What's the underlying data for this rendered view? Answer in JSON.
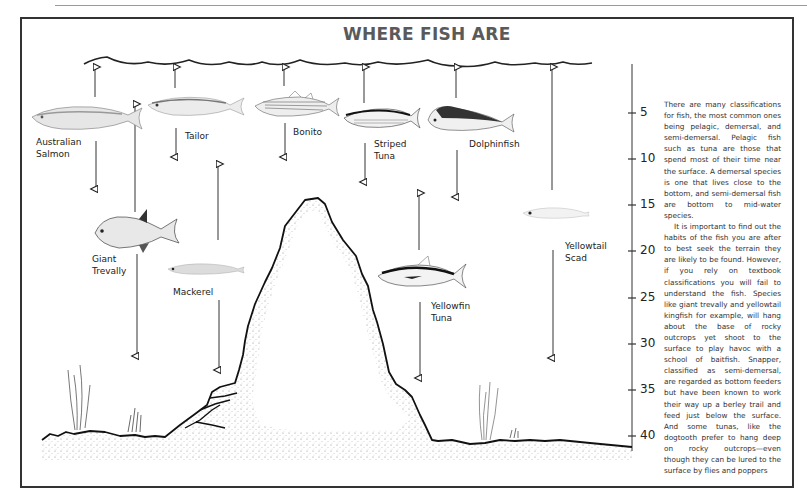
{
  "title": "WHERE FISH ARE",
  "depth_scale": {
    "ticks": [
      "5",
      "10",
      "15",
      "20",
      "25",
      "30",
      "35",
      "40"
    ]
  },
  "fish": [
    {
      "name": "australian-salmon",
      "label_line1": "Australian",
      "label_line2": "Salmon"
    },
    {
      "name": "tailor",
      "label_line1": "Tailor",
      "label_line2": ""
    },
    {
      "name": "bonito",
      "label_line1": "Bonito",
      "label_line2": ""
    },
    {
      "name": "striped-tuna",
      "label_line1": "Striped",
      "label_line2": "Tuna"
    },
    {
      "name": "dolphinfish",
      "label_line1": "Dolphinfish",
      "label_line2": ""
    },
    {
      "name": "giant-trevally",
      "label_line1": "Giant",
      "label_line2": "Trevally"
    },
    {
      "name": "mackerel",
      "label_line1": "Mackerel",
      "label_line2": ""
    },
    {
      "name": "yellowfin-tuna",
      "label_line1": "Yellowfin",
      "label_line2": "Tuna"
    },
    {
      "name": "yellowtail-scad",
      "label_line1": "Yellowtail",
      "label_line2": "Scad"
    }
  ],
  "body_text": {
    "paragraph1": "There are many classifications for fish, the most common ones being pelagic, demersal, and semi-demersal. Pelagic fish such as tuna are those that spend most of their time near the surface. A demersal species is one that lives close to the bottom, and semi-demersal fish are bottom to mid-water species.",
    "paragraph2": "It is important to find out the habits of the fish you are after to best seek the terrain they are likely to be found. However, if you rely on textbook classifications you will fail to understand the fish. Species like giant trevally and yellowtail kingfish for example, will hang about the base of rocky outcrops yet shoot to the surface to play havoc with a school of baitfish. Snapper, classified as semi-demersal, are regarded as bottom feeders but have been known to work their way up a berley trail and feed just below the surface. And some tunas, like the dogtooth prefer to hang deep on rocky outcrops—even though they can be lured to the surface by flies and poppers"
  }
}
